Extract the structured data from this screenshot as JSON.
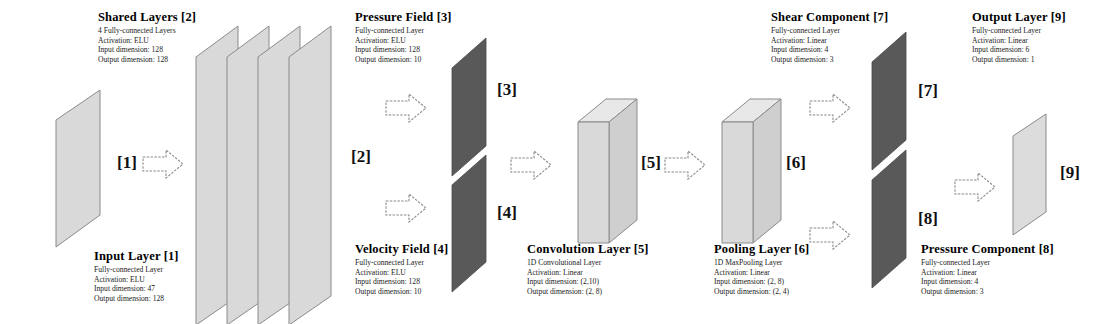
{
  "diagram": {
    "colors": {
      "plane_light": "#d9d9d9",
      "plane_light_edge": "#8c8c8c",
      "plane_dark": "#595959",
      "box_face": "#d4d4d4",
      "box_top": "#e6e6e6",
      "arrow_fill": "#ffffff",
      "arrow_stroke": "#7a7a7a",
      "text": "#000000",
      "background": "#ffffff"
    },
    "blocks": [
      {
        "id": "1",
        "title": "Input Layer [1]",
        "lines": [
          "Fully-connected Layer",
          "Activation: ELU",
          "Input dimension: 47",
          "Output dimension: 128"
        ]
      },
      {
        "id": "2",
        "title": "Shared Layers [2]",
        "lines": [
          "4 Fully-connected Layers",
          "Activation: ELU",
          "Input dimension: 128",
          "Output dimension: 128"
        ]
      },
      {
        "id": "3",
        "title": "Pressure Field [3]",
        "lines": [
          "Fully-connected Layer",
          "Activation: ELU",
          "Input dimension: 128",
          "Output dimension: 10"
        ]
      },
      {
        "id": "4",
        "title": "Velocity Field [4]",
        "lines": [
          "Fully-connected Layer",
          "Activation: ELU",
          "Input dimension: 128",
          "Output dimension: 10"
        ]
      },
      {
        "id": "5",
        "title": "Convolution Layer [5]",
        "lines": [
          "1D Convolutional Layer",
          "Activation: Linear",
          "Input dimension: (2,10)",
          "Output dimension: (2, 8)"
        ]
      },
      {
        "id": "6",
        "title": "Pooling Layer [6]",
        "lines": [
          "1D MaxPooling Layer",
          "Activation: Linear",
          "Input dimension: (2, 8)",
          "Output dimension: (2, 4)"
        ]
      },
      {
        "id": "7",
        "title": "Shear Component [7]",
        "lines": [
          "Fully-connected Layer",
          "Activation: Linear",
          "Input dimension: 4",
          "Output dimension: 3"
        ]
      },
      {
        "id": "8",
        "title": "Pressure Component [8]",
        "lines": [
          "Fully-connected Layer",
          "Activation: Linear",
          "Input dimension: 4",
          "Output dimension: 3"
        ]
      },
      {
        "id": "9",
        "title": "Output Layer [9]",
        "lines": [
          "Fully-connected Layer",
          "Activation: Linear",
          "Input dimension: 6",
          "Output dimension: 1"
        ]
      }
    ],
    "connection_tags": [
      {
        "label": "[1]"
      },
      {
        "label": "[2]"
      },
      {
        "label": "[3]"
      },
      {
        "label": "[4]"
      },
      {
        "label": "[5]"
      },
      {
        "label": "[6]"
      },
      {
        "label": "[7]"
      },
      {
        "label": "[8]"
      },
      {
        "label": "[9]"
      }
    ]
  }
}
